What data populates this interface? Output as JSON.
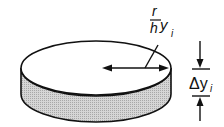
{
  "diagram": {
    "radius_label": {
      "numerator": "r",
      "denominator": "h",
      "variable": "y",
      "subscript": "i"
    },
    "thickness_label": {
      "symbol": "Δy",
      "subscript": "i"
    },
    "colors": {
      "stroke": "#111111",
      "side_fill": "#c8c8c8",
      "top_fill": "#ffffff"
    }
  }
}
